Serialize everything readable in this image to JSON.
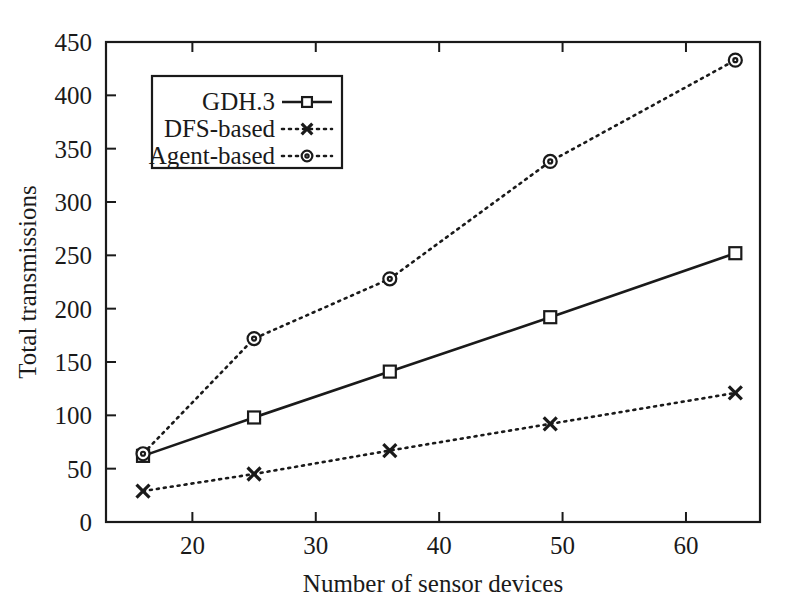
{
  "chart_data": {
    "type": "line",
    "title": "",
    "xlabel": "Number of sensor devices",
    "ylabel": "Total transmissions",
    "x": [
      16,
      25,
      36,
      49,
      64
    ],
    "xlim": [
      13,
      66
    ],
    "ylim": [
      0,
      450
    ],
    "xticks": [
      20,
      30,
      40,
      50,
      60
    ],
    "yticks": [
      0,
      50,
      100,
      150,
      200,
      250,
      300,
      350,
      400,
      450
    ],
    "grid": false,
    "legend_position": "upper left",
    "series": [
      {
        "name": "GDH.3",
        "marker": "square",
        "linestyle": "solid",
        "values": [
          62,
          98,
          141,
          192,
          252
        ]
      },
      {
        "name": "DFS-based",
        "marker": "x",
        "linestyle": "dotted",
        "values": [
          29,
          45,
          67,
          92,
          121
        ]
      },
      {
        "name": "Agent-based",
        "marker": "circle",
        "linestyle": "dotted",
        "values": [
          64,
          172,
          228,
          338,
          433
        ]
      }
    ]
  },
  "axes": {
    "x_title": "Number of sensor devices",
    "y_title": "Total transmissions",
    "x_tick_labels": [
      "20",
      "30",
      "40",
      "50",
      "60"
    ],
    "y_tick_labels": [
      "0",
      "50",
      "100",
      "150",
      "200",
      "250",
      "300",
      "350",
      "400",
      "450"
    ]
  },
  "legend": {
    "entries": [
      {
        "label": "GDH.3",
        "marker": "square-marker",
        "style": "solid"
      },
      {
        "label": "DFS-based",
        "marker": "x-marker",
        "style": "dotted"
      },
      {
        "label": "Agent-based",
        "marker": "circle-marker",
        "style": "dotted"
      }
    ]
  },
  "colors": {
    "ink": "#1a1a1a",
    "background": "#ffffff"
  }
}
